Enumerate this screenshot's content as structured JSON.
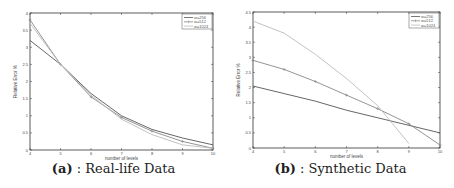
{
  "figures": [
    {
      "caption_label": "(a)",
      "caption_text": ": Real-life Data"
    },
    {
      "caption_label": "(b)",
      "caption_text": ": Synthetic Data"
    }
  ],
  "chart_data": [
    {
      "type": "line",
      "title": "(a) : Real-life Data",
      "xlabel": "number of levels",
      "ylabel": "Relative Error %",
      "x": [
        4,
        5,
        6,
        7,
        8,
        9,
        10
      ],
      "xlim": [
        4,
        10
      ],
      "ylim": [
        0,
        4
      ],
      "xticks": [
        "4",
        "5",
        "6",
        "7",
        "8",
        "9",
        "10"
      ],
      "yticks": [
        "0",
        "0.5",
        "1",
        "1.5",
        "2",
        "2.5",
        "3",
        "3.5",
        "4"
      ],
      "legend_position": "top-right",
      "grid": false,
      "series": [
        {
          "name": "w=256",
          "color": "#555555",
          "marker": "none",
          "values": [
            3.2,
            2.5,
            1.65,
            1.0,
            0.6,
            0.35,
            0.15
          ]
        },
        {
          "name": "w=512",
          "color": "#888888",
          "marker": "+",
          "values": [
            3.8,
            2.5,
            1.55,
            0.95,
            0.55,
            0.25,
            0.05
          ]
        },
        {
          "name": "w=1024",
          "color": "#bbbbbb",
          "marker": "none",
          "values": [
            3.7,
            2.5,
            1.6,
            0.9,
            0.45,
            0.15,
            0.05
          ]
        }
      ]
    },
    {
      "type": "line",
      "title": "(b) : Synthetic Data",
      "xlabel": "number of levels",
      "ylabel": "Relative Error %",
      "x": [
        4,
        5,
        6,
        7,
        8,
        9,
        10
      ],
      "xlim": [
        4,
        10
      ],
      "ylim": [
        0,
        4.5
      ],
      "xticks": [
        "4",
        "5",
        "6",
        "7",
        "8",
        "9",
        "10"
      ],
      "yticks": [
        "0",
        "0.5",
        "1",
        "1.5",
        "2",
        "2.5",
        "3",
        "3.5",
        "4",
        "4.5"
      ],
      "legend_position": "top-right",
      "grid": false,
      "series": [
        {
          "name": "w=256",
          "color": "#555555",
          "marker": "none",
          "values": [
            2.05,
            1.8,
            1.55,
            1.25,
            1.0,
            0.75,
            0.5
          ]
        },
        {
          "name": "w=512",
          "color": "#888888",
          "marker": "+",
          "values": [
            2.9,
            2.6,
            2.2,
            1.75,
            1.3,
            0.8,
            0.1
          ]
        },
        {
          "name": "w=1024",
          "color": "#bbbbbb",
          "marker": "none",
          "values": [
            4.2,
            3.8,
            3.1,
            2.3,
            1.4,
            0.15,
            null
          ]
        }
      ]
    }
  ]
}
